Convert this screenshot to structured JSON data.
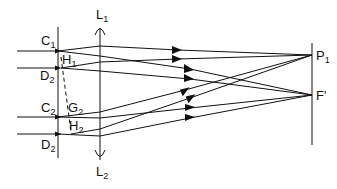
{
  "diagram": {
    "type": "optical-ray-diagram",
    "labels": {
      "C1": {
        "main": "C",
        "sub": "1"
      },
      "D2_top": {
        "main": "D",
        "sub": "2"
      },
      "H1": {
        "main": "H",
        "sub": "1"
      },
      "C2": {
        "main": "C",
        "sub": "2"
      },
      "G2": {
        "main": "G",
        "sub": "2"
      },
      "H2": {
        "main": "H",
        "sub": "2"
      },
      "D2_bottom": {
        "main": "D",
        "sub": "2"
      },
      "L1": {
        "main": "L",
        "sub": "1"
      },
      "L2": {
        "main": "L",
        "sub": "2"
      },
      "P1": {
        "main": "P",
        "sub": "1"
      },
      "Fprime": {
        "main": "F'",
        "sub": ""
      }
    },
    "elements": [
      "aperture plate",
      "lens L1-L2",
      "focal screen"
    ],
    "points": [
      "P1",
      "F'"
    ],
    "stroke_color": "#111111"
  }
}
